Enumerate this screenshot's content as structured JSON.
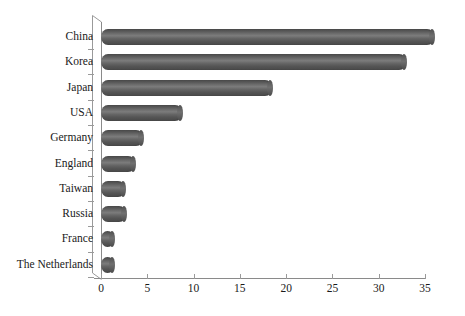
{
  "chart_data": {
    "type": "bar",
    "orientation": "horizontal",
    "style": "3d-cylinder",
    "title": "",
    "subtitle": "",
    "xlabel": "",
    "ylabel": "",
    "categories": [
      "China",
      "Korea",
      "Japan",
      "USA",
      "Germany",
      "England",
      "Taiwan",
      "Russia",
      "France",
      "The Netherlands"
    ],
    "values": [
      36,
      33,
      18.5,
      8.8,
      4.5,
      3.7,
      2.6,
      2.7,
      1.4,
      1.4
    ],
    "xlim": [
      0,
      35
    ],
    "xticks": [
      0,
      5,
      10,
      15,
      20,
      25,
      30,
      35
    ],
    "xtick_labels": [
      "0",
      "5",
      "10",
      "15",
      "20",
      "25",
      "30",
      "35"
    ],
    "grid": false,
    "legend": null,
    "legend_position": "none",
    "annotations": [],
    "series": [
      {
        "name": "",
        "values": [
          36,
          33,
          18.5,
          8.8,
          4.5,
          3.7,
          2.6,
          2.7,
          1.4,
          1.4
        ]
      }
    ]
  },
  "colors": {
    "background": "#ffffff",
    "bar_fill": "#595959",
    "bar_highlight": "#7c7c7c",
    "bar_shadow": "#484848",
    "axis": "#8a8a8a",
    "text": "#1a1a1a"
  }
}
